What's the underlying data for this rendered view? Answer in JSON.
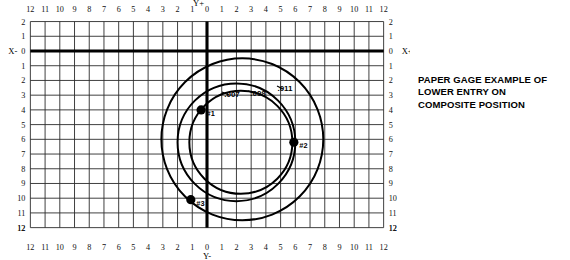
{
  "figure": {
    "name": "paper-gage-polar-grid",
    "axis_labels": {
      "top": "Y+",
      "bottom": "Y-",
      "left": "X-",
      "right": "X+"
    },
    "horizontal_ticks": [
      12,
      11,
      10,
      9,
      8,
      7,
      6,
      5,
      4,
      3,
      2,
      1,
      0,
      1,
      2,
      3,
      4,
      5,
      6,
      7,
      8,
      9,
      10,
      11,
      12
    ],
    "vertical_ticks": [
      2,
      1,
      0,
      1,
      2,
      3,
      4,
      5,
      6,
      7,
      8,
      9,
      10,
      11,
      12
    ],
    "corner_ticks": {
      "left": "12",
      "right": "12"
    },
    "grid_color": "#2b2b2b",
    "axis_color": "#000000",
    "background_color": "#ffffff"
  },
  "chart_data": {
    "type": "scatter",
    "title": "",
    "xlabel": "",
    "ylabel": "",
    "xlim": [
      -12,
      12
    ],
    "ylim": [
      -12,
      2
    ],
    "grid": true,
    "legend": "none",
    "units": "thousandths of an inch",
    "points": [
      {
        "label": "#1",
        "x": -0.4,
        "y": -4.0
      },
      {
        "label": "#2",
        "x": 5.9,
        "y": -6.2
      },
      {
        "label": "#3",
        "x": -1.1,
        "y": -10.1
      }
    ],
    "circles": [
      {
        "label": ".007",
        "diameter": 7,
        "center_x": 2.3,
        "center_y": -6.2,
        "radius": 3.5
      },
      {
        "label": ".008",
        "diameter": 8,
        "center_x": 2.0,
        "center_y": -6.2,
        "radius": 4.0
      },
      {
        "label": ".011",
        "diameter": 11,
        "center_x": 2.4,
        "center_y": -6.0,
        "radius": 5.5
      }
    ]
  },
  "caption": {
    "lines": [
      "PAPER GAGE EXAMPLE OF",
      "LOWER ENTRY ON",
      "COMPOSITE POSITION"
    ]
  }
}
